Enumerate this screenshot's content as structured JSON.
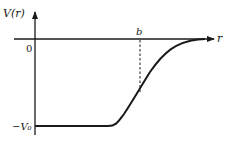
{
  "diagram": {
    "type": "potential-well-plot",
    "y_axis_label": "V(r)",
    "x_axis_label": "r",
    "origin_label": "0",
    "depth_label": "−V₀",
    "marker_label": "b",
    "colors": {
      "ink": "#1a1a1a",
      "background": "#ffffff"
    }
  }
}
